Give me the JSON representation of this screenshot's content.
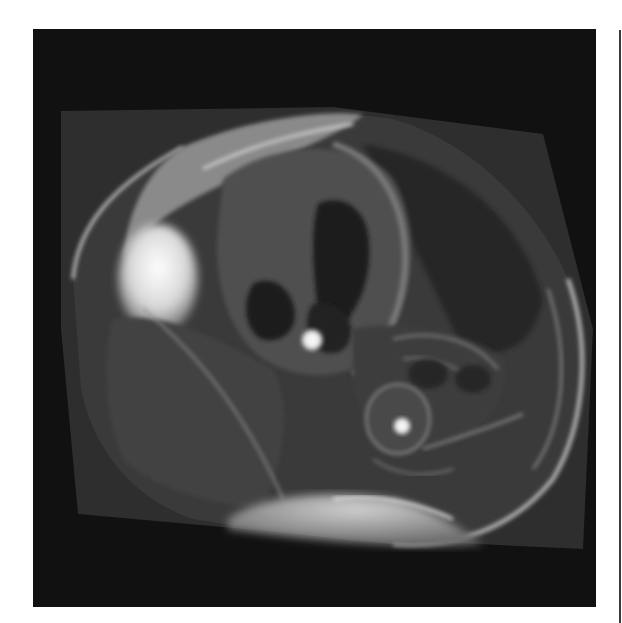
{
  "image": {
    "type": "cardiac-mri",
    "view": "axial four-chamber",
    "modality": "MRI",
    "background_color": "#111111",
    "page_color": "#ffffff",
    "visible_text": []
  },
  "figure": {
    "caption": "Cardiac MRI axial slice showing heart chambers, descending aorta and chest wall"
  }
}
